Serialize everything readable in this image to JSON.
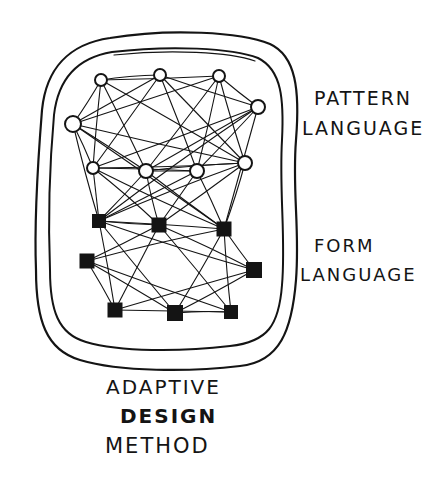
{
  "diagram": {
    "style": "hand-drawn ink sketch",
    "ink_color": "#141414",
    "background": "#ffffff",
    "labels": {
      "pattern_language": [
        "PATTERN",
        "LANGUAGE"
      ],
      "form_language": [
        "FORM",
        "LANGUAGE"
      ],
      "method": [
        "ADAPTIVE",
        "DESIGN",
        "METHOD"
      ]
    },
    "groups": [
      {
        "name": "pattern-language",
        "node_shape": "open-circle",
        "count": 9
      },
      {
        "name": "form-language",
        "node_shape": "filled-square",
        "count": 8
      }
    ],
    "nodes": {
      "circles": [
        {
          "x": 101,
          "y": 80,
          "r": 6
        },
        {
          "x": 160,
          "y": 75,
          "r": 6
        },
        {
          "x": 219,
          "y": 76,
          "r": 6
        },
        {
          "x": 258,
          "y": 107,
          "r": 7
        },
        {
          "x": 73,
          "y": 124,
          "r": 8
        },
        {
          "x": 93,
          "y": 168,
          "r": 6
        },
        {
          "x": 146,
          "y": 171,
          "r": 7
        },
        {
          "x": 197,
          "y": 171,
          "r": 7
        },
        {
          "x": 245,
          "y": 163,
          "r": 7
        }
      ],
      "squares": [
        {
          "x": 99,
          "y": 221,
          "s": 14
        },
        {
          "x": 159,
          "y": 225,
          "s": 15
        },
        {
          "x": 224,
          "y": 229,
          "s": 15
        },
        {
          "x": 87,
          "y": 261,
          "s": 15
        },
        {
          "x": 254,
          "y": 270,
          "s": 16
        },
        {
          "x": 115,
          "y": 310,
          "s": 15
        },
        {
          "x": 175,
          "y": 313,
          "s": 16
        },
        {
          "x": 231,
          "y": 312,
          "s": 14
        }
      ]
    },
    "enclosures": [
      {
        "name": "outer-boundary"
      },
      {
        "name": "inner-boundary"
      }
    ]
  }
}
